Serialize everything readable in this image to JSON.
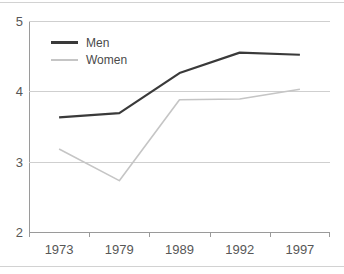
{
  "chart_data": {
    "type": "line",
    "title": "",
    "subtitle": "",
    "xlabel": "",
    "ylabel": "",
    "categories": [
      "1973",
      "1979",
      "1989",
      "1992",
      "1997"
    ],
    "series": [
      {
        "name": "Men",
        "values": [
          3.63,
          3.69,
          4.26,
          4.55,
          4.52
        ],
        "color": "#3a3a3a",
        "width": 2.2
      },
      {
        "name": "Women",
        "values": [
          3.18,
          2.73,
          3.88,
          3.89,
          4.03
        ],
        "color": "#c5c5c5",
        "width": 1.6
      }
    ],
    "ylim": [
      2,
      5
    ],
    "yticks": [
      2,
      3,
      4,
      5
    ],
    "ytick_labels": [
      "2",
      "3",
      "4",
      "5"
    ],
    "xlim_categories": 5,
    "grid": {
      "horizontal": true,
      "vertical": false
    },
    "legend": {
      "position": "top-left",
      "entries": [
        "Men",
        "Women"
      ]
    },
    "annotations": []
  },
  "axes": {
    "y_labels": [
      "5",
      "4",
      "3",
      "2"
    ],
    "x_labels": [
      "1973",
      "1979",
      "1989",
      "1992",
      "1997"
    ]
  },
  "legend": {
    "men_label": "Men",
    "women_label": "Women"
  },
  "colors": {
    "men_line": "#3a3a3a",
    "women_line": "#c5c5c5",
    "gridline": "#cfcfcf",
    "axis": "#9a9a9a",
    "text": "#575757",
    "background": "#ffffff"
  }
}
